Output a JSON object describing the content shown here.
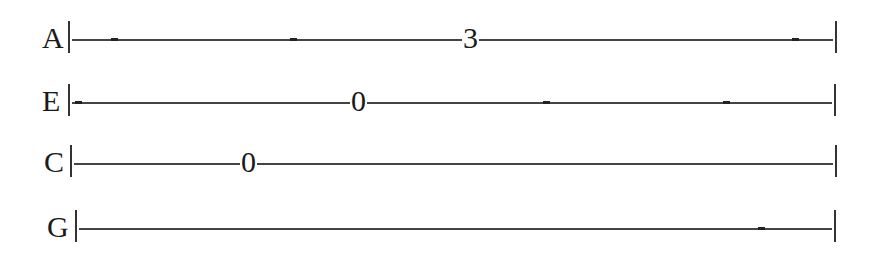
{
  "tab": {
    "strings": [
      {
        "name": "A",
        "label_x": 42,
        "y": 39,
        "start": 68,
        "end": 835,
        "dashes": [
          111,
          290,
          792
        ],
        "notes": [
          {
            "fret": "3",
            "x": 462
          }
        ]
      },
      {
        "name": "E",
        "label_x": 42,
        "y": 102,
        "start": 68,
        "end": 834,
        "dashes": [
          75,
          543,
          723
        ],
        "notes": [
          {
            "fret": "0",
            "x": 350
          }
        ]
      },
      {
        "name": "C",
        "label_x": 44,
        "y": 163,
        "start": 70,
        "end": 835,
        "dashes": [],
        "notes": [
          {
            "fret": "0",
            "x": 240
          }
        ]
      },
      {
        "name": "G",
        "label_x": 47,
        "y": 228,
        "start": 75,
        "end": 834,
        "dashes": [
          758
        ],
        "notes": []
      }
    ]
  }
}
